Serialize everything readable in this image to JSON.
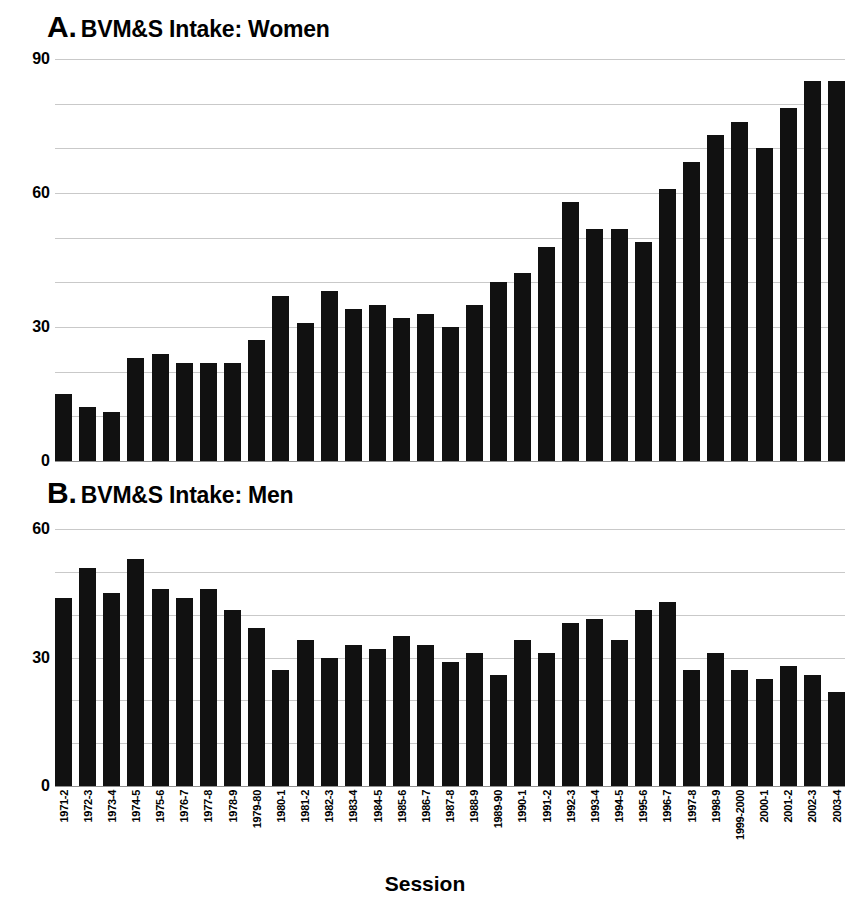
{
  "figure": {
    "xaxis_title": "Session",
    "panels": [
      {
        "letter": "A.",
        "title": "BVM&S Intake: Women"
      },
      {
        "letter": "B.",
        "title": "BVM&S Intake: Men"
      }
    ]
  },
  "chart_data": [
    {
      "type": "bar",
      "panel": "A",
      "title": "A. BVM&S Intake: Women",
      "xlabel": "Session",
      "ylabel": "",
      "ylim": [
        0,
        90
      ],
      "yticks": [
        0,
        30,
        60,
        90
      ],
      "ytick_labels": [
        "0",
        "30",
        "60",
        "90"
      ],
      "gridlines": [
        0,
        10,
        20,
        30,
        40,
        50,
        60,
        70,
        80,
        90
      ],
      "grid": true,
      "legend": "none",
      "bar_color": "#111111",
      "categories": [
        "1971-2",
        "1972-3",
        "1973-4",
        "1974-5",
        "1975-6",
        "1976-7",
        "1977-8",
        "1978-9",
        "1979-80",
        "1980-1",
        "1981-2",
        "1982-3",
        "1983-4",
        "1984-5",
        "1985-6",
        "1986-7",
        "1987-8",
        "1988-9",
        "1989-90",
        "1990-1",
        "1991-2",
        "1992-3",
        "1993-4",
        "1994-5",
        "1995-6",
        "1996-7",
        "1997-8",
        "1998-9",
        "1999-2000",
        "2000-1",
        "2001-2",
        "2002-3",
        "2003-4"
      ],
      "values": [
        15,
        12,
        11,
        23,
        24,
        22,
        22,
        22,
        27,
        37,
        31,
        38,
        34,
        35,
        32,
        33,
        30,
        35,
        40,
        42,
        48,
        58,
        52,
        52,
        49,
        61,
        67,
        73,
        76,
        70,
        79,
        85,
        85
      ]
    },
    {
      "type": "bar",
      "panel": "B",
      "title": "B. BVM&S Intake: Men",
      "xlabel": "Session",
      "ylabel": "",
      "ylim": [
        0,
        60
      ],
      "yticks": [
        0,
        30,
        60
      ],
      "ytick_labels": [
        "0",
        "30",
        "60"
      ],
      "gridlines": [
        0,
        10,
        20,
        30,
        40,
        50,
        60
      ],
      "grid": true,
      "legend": "none",
      "bar_color": "#111111",
      "categories": [
        "1971-2",
        "1972-3",
        "1973-4",
        "1974-5",
        "1975-6",
        "1976-7",
        "1977-8",
        "1978-9",
        "1979-80",
        "1980-1",
        "1981-2",
        "1982-3",
        "1983-4",
        "1984-5",
        "1985-6",
        "1986-7",
        "1987-8",
        "1988-9",
        "1989-90",
        "1990-1",
        "1991-2",
        "1992-3",
        "1993-4",
        "1994-5",
        "1995-6",
        "1996-7",
        "1997-8",
        "1998-9",
        "1999-2000",
        "2000-1",
        "2001-2",
        "2002-3",
        "2003-4"
      ],
      "values": [
        44,
        51,
        45,
        53,
        46,
        44,
        46,
        41,
        37,
        27,
        34,
        30,
        33,
        32,
        35,
        33,
        29,
        31,
        26,
        34,
        31,
        38,
        39,
        34,
        41,
        43,
        27,
        31,
        27,
        25,
        28,
        26,
        22,
        24
      ]
    }
  ]
}
